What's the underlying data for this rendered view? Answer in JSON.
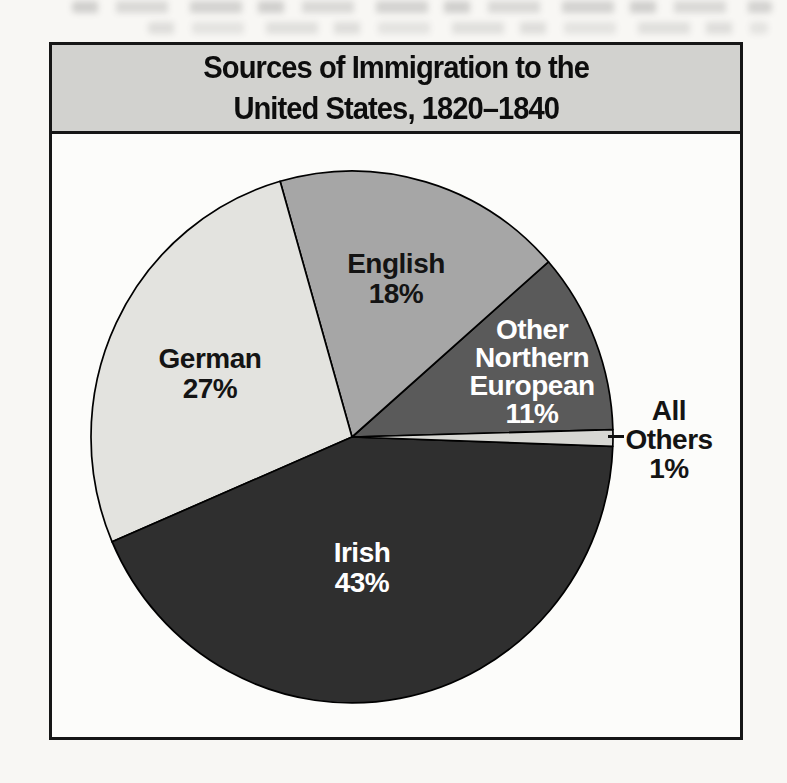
{
  "chart": {
    "title_line1": "Sources of Immigration to the",
    "title_line2": "United States, 1820–1840",
    "header_bg": "#d2d2cf",
    "border_color": "#161616"
  },
  "chart_data": {
    "type": "pie",
    "title": "Sources of Immigration to the United States, 1820–1840",
    "unit": "percent",
    "legend_position": "labels-on-slices",
    "start_angle_deg": 1.6,
    "direction": "counterclockwise",
    "center": {
      "x": 300,
      "y": 392
    },
    "radius": {
      "rx": 261,
      "ry": 266
    },
    "stroke": "#000000",
    "slices": [
      {
        "name": "Other Northern European",
        "value": 11,
        "color": "#5a5a5a",
        "label": "Other\nNorthern\nEuropean\n11%",
        "label_color": "#ffffff"
      },
      {
        "name": "English",
        "value": 18,
        "color": "#a6a6a6",
        "label": "English\n18%",
        "label_color": "#141414"
      },
      {
        "name": "German",
        "value": 27,
        "color": "#e3e3df",
        "label": "German\n27%",
        "label_color": "#141414"
      },
      {
        "name": "Irish",
        "value": 43,
        "color": "#2f2f2f",
        "label": "Irish\n43%",
        "label_color": "#ffffff"
      },
      {
        "name": "All Others",
        "value": 1,
        "color": "#d7d7d3",
        "label": "All\nOthers\n1%",
        "label_color": "#141414",
        "label_outside": true
      }
    ]
  }
}
